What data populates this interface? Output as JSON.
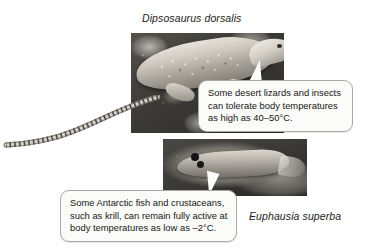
{
  "figure": {
    "background_color": "#ffffff",
    "width": 365,
    "height": 252
  },
  "specimens": [
    {
      "id": "desert-iguana",
      "caption": "Dipsosaurus dorsalis",
      "photo_alt": "desert iguana lizard on rock",
      "callout": {
        "lines": [
          "Some desert lizards and insects",
          "can tolerate body temperatures",
          "as high as 40–50°C."
        ],
        "text": "Some desert lizards and insects can tolerate body temperatures as high as 40–50°C.",
        "temperature_range": "40–50°C",
        "border_color": "#a9a9a7",
        "fill_color": "#fbfbfa"
      }
    },
    {
      "id": "antarctic-krill",
      "caption": "Euphausia superba",
      "photo_alt": "antarctic krill crustacean",
      "callout": {
        "lines": [
          "Some Antarctic fish and crustaceans,",
          "such as krill, can remain fully active at",
          "body temperatures as low as –2°C."
        ],
        "text": "Some Antarctic fish and crustaceans, such as krill, can remain fully active at body temperatures as low as –2°C.",
        "temperature_range": "–2°C",
        "border_color": "#a9a9a7",
        "fill_color": "#fbfbfa"
      }
    }
  ]
}
